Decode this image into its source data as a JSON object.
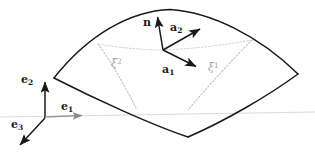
{
  "figure": {
    "kind": "surface-patch-differential-geometry-diagram",
    "background_color": "#ffffff",
    "stroke_color": "#1a1a1a",
    "gray_color": "#a9a9a9",
    "width": 315,
    "height": 153
  },
  "labels": {
    "normal_vector": "n",
    "tangent_vector_1_base": "a",
    "tangent_vector_1_sub": "1",
    "tangent_vector_2_base": "a",
    "tangent_vector_2_sub": "2",
    "basis_1_base": "e",
    "basis_1_sub": "1",
    "basis_2_base": "e",
    "basis_2_sub": "2",
    "basis_3_base": "e",
    "basis_3_sub": "3",
    "coord_curve_1_base": "ξ",
    "coord_curve_1_sup": "1",
    "coord_curve_2_base": "ξ",
    "coord_curve_2_sup": "2"
  },
  "geometry": {
    "patch_outline": "M 54,78 C 90,36 132,12 170,10 C 210,13 258,36 298,74",
    "patch_bottom_left": "M 54,78 C 96,100 150,124 188,137",
    "patch_bottom_right": "M 188,137 C 226,120 268,95 298,74",
    "tangent_point": {
      "x": 163,
      "y": 50
    },
    "normal_tip": {
      "x": 157,
      "y": 16
    },
    "a2_tip": {
      "x": 201,
      "y": 29
    },
    "a1_tip": {
      "x": 197,
      "y": 67
    },
    "origin": {
      "x": 45,
      "y": 118
    },
    "e2_tip": {
      "x": 45,
      "y": 81
    },
    "e1_tip": {
      "x": 84,
      "y": 118
    },
    "e3_tip": {
      "x": 19,
      "y": 146
    },
    "ground_line": {
      "x1": 0,
      "y1": 117,
      "x2": 315,
      "y2": 112
    },
    "xi2_curve": "M 98,44 C 112,62 126,86 136,108",
    "xi1_curve": "M 252,40 C 232,60 208,86 188,110"
  }
}
